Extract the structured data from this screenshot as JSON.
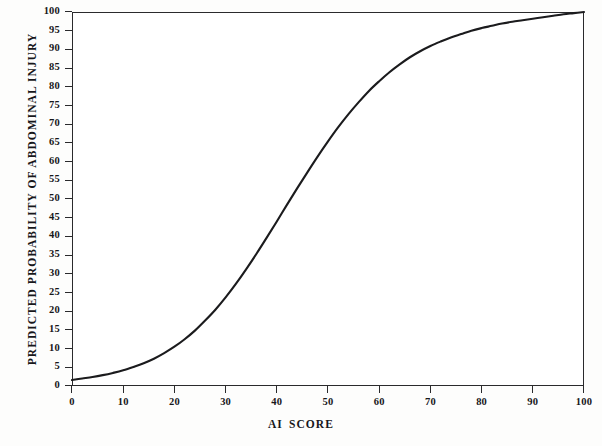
{
  "figure": {
    "background_color": "#fdfdfc",
    "plot_background_color": "#ffffff",
    "axis_color": "#2a2a2c",
    "curve_color": "#1b1b1d"
  },
  "chart_data": {
    "type": "line",
    "title": "",
    "subtitle": "",
    "xlabel": "AI  SCORE",
    "xlabel_parts": [
      "AI",
      "SCORE"
    ],
    "ylabel": "PREDICTED PROBABILITY OF ABDOMINAL INJURY",
    "xlim": [
      0,
      100
    ],
    "ylim": [
      0,
      100
    ],
    "xticks": [
      0,
      10,
      20,
      30,
      40,
      50,
      60,
      70,
      80,
      90,
      100
    ],
    "xtick_labels": [
      "0",
      "10",
      "20",
      "30",
      "40",
      "50",
      "60",
      "70",
      "80",
      "90",
      "100"
    ],
    "yticks": [
      0,
      5,
      10,
      15,
      20,
      25,
      30,
      35,
      40,
      45,
      50,
      55,
      60,
      65,
      70,
      75,
      80,
      85,
      90,
      95,
      100
    ],
    "ytick_labels": [
      "0",
      "5",
      "10",
      "15",
      "20",
      "25",
      "30",
      "35",
      "40",
      "45",
      "50",
      "55",
      "60",
      "65",
      "70",
      "75",
      "80",
      "85",
      "90",
      "95",
      "100"
    ],
    "grid": false,
    "legend": null,
    "legend_position": "none",
    "annotations": [],
    "series": [
      {
        "name": "Predicted probability of abdominal injury",
        "x": [
          0,
          2,
          4,
          6,
          8,
          10,
          12,
          14,
          16,
          18,
          20,
          22,
          24,
          26,
          28,
          30,
          32,
          34,
          36,
          38,
          40,
          42,
          44,
          46,
          48,
          50,
          52,
          54,
          56,
          58,
          60,
          62,
          64,
          66,
          68,
          70,
          72,
          74,
          76,
          78,
          80,
          82,
          84,
          86,
          88,
          90,
          92,
          94,
          96,
          98,
          100
        ],
        "values": [
          1.6,
          2.0,
          2.4,
          2.9,
          3.5,
          4.2,
          5.1,
          6.1,
          7.3,
          8.8,
          10.5,
          12.5,
          14.8,
          17.5,
          20.4,
          23.7,
          27.3,
          31.2,
          35.3,
          39.6,
          44.0,
          48.5,
          52.9,
          57.2,
          61.4,
          65.4,
          69.2,
          72.7,
          75.9,
          78.9,
          81.5,
          83.9,
          86.0,
          87.9,
          89.5,
          90.9,
          92.1,
          93.2,
          94.1,
          95.0,
          95.7,
          96.3,
          96.9,
          97.4,
          97.8,
          98.2,
          98.6,
          99.0,
          99.4,
          99.7,
          100.0
        ]
      }
    ]
  }
}
